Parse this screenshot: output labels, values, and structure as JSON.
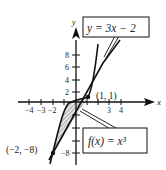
{
  "figure": {
    "axes": {
      "x_label": "x",
      "y_label": "y",
      "x_ticks": [
        {
          "value": -4,
          "label": "−4"
        },
        {
          "value": -3,
          "label": "−3"
        },
        {
          "value": -2,
          "label": "−2"
        },
        {
          "value": -1,
          "label": ""
        },
        {
          "value": 1,
          "label": ""
        },
        {
          "value": 2,
          "label": ""
        },
        {
          "value": 3,
          "label": "3"
        },
        {
          "value": 4,
          "label": "4"
        }
      ],
      "y_ticks": [
        {
          "value": 8,
          "label": "8"
        },
        {
          "value": 6,
          "label": "6"
        },
        {
          "value": 4,
          "label": "4"
        },
        {
          "value": 2,
          "label": "2"
        },
        {
          "value": -2,
          "label": ""
        },
        {
          "value": -4,
          "label": ""
        },
        {
          "value": -6,
          "label": ""
        },
        {
          "value": -8,
          "label": "−8"
        }
      ]
    },
    "curves": [
      {
        "name": "line",
        "label": "y = 3x − 2"
      },
      {
        "name": "cubic",
        "label": "f(x) = x³"
      }
    ],
    "points": [
      {
        "label": "(1, 1)",
        "x": 1,
        "y": 1
      },
      {
        "label": "(−2, −8)",
        "x": -2,
        "y": -8
      }
    ],
    "shaded_region": "between y = 3x − 2 and f(x) = x³ for −2 ≤ x ≤ 1",
    "colors": {
      "ink": "#111111",
      "shade": "#9a9a9a"
    }
  }
}
